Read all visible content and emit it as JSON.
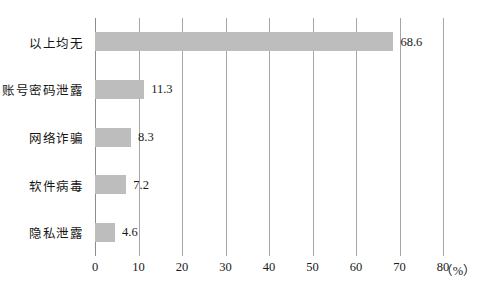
{
  "chart_data": {
    "type": "bar",
    "orientation": "horizontal",
    "title": "",
    "subtitle": "",
    "xlabel": "",
    "ylabel": "",
    "unit_label": "（%）",
    "categories": [
      "以上均无",
      "账号密码泄露",
      "网络诈骗",
      "软件病毒",
      "隐私泄露"
    ],
    "values": [
      68.6,
      11.3,
      8.3,
      7.2,
      4.6
    ],
    "value_labels": [
      "68.6",
      "11.3",
      "8.3",
      "7.2",
      "4.6"
    ],
    "xlim": [
      0,
      80
    ],
    "xticks": [
      0,
      10,
      20,
      30,
      40,
      50,
      60,
      70,
      80
    ],
    "xtick_labels": [
      "0",
      "10",
      "20",
      "30",
      "40",
      "50",
      "60",
      "70",
      "80"
    ],
    "grid": "vertical",
    "legend": "none",
    "bar_color": "#bdbdbd",
    "gridline_color": "#a6a6a6",
    "text_color": "#1a1a1a",
    "background_color": "#ffffff"
  }
}
